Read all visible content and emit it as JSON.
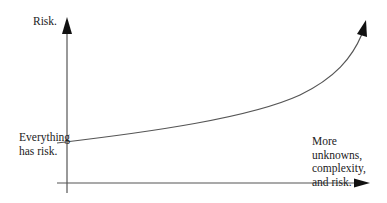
{
  "diagram": {
    "y_axis_label": "Risk.",
    "start_label": [
      "Everything",
      "has risk."
    ],
    "end_label": [
      "More",
      "unknowns,",
      "complexity,",
      "and risk."
    ]
  },
  "colors": {
    "axis": "#555555",
    "curve": "#555555",
    "arrowhead": "#111111",
    "text": "#222222"
  }
}
